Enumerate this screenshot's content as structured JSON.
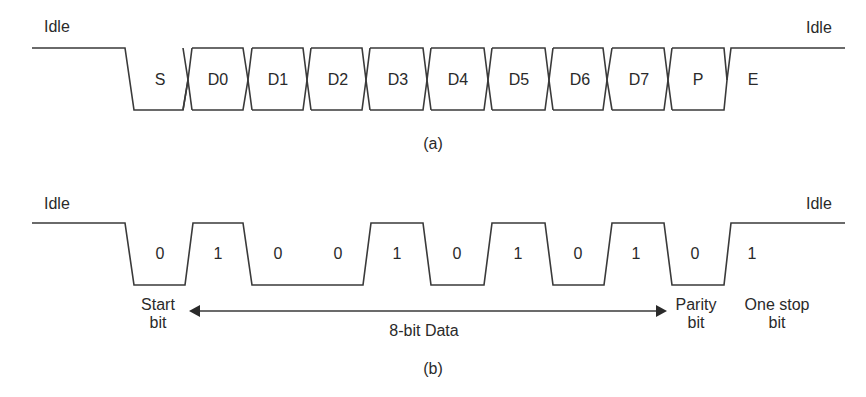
{
  "panel_a": {
    "idle_left": "Idle",
    "idle_right": "Idle",
    "caption": "(a)",
    "fields": [
      "S",
      "D0",
      "D1",
      "D2",
      "D3",
      "D4",
      "D5",
      "D6",
      "D7",
      "P",
      "E"
    ]
  },
  "panel_b": {
    "idle_left": "Idle",
    "idle_right": "Idle",
    "caption": "(b)",
    "bits": [
      "0",
      "1",
      "0",
      "0",
      "1",
      "0",
      "1",
      "0",
      "1",
      "0",
      "1"
    ],
    "annotations": {
      "start_bit_line1": "Start",
      "start_bit_line2": "bit",
      "data_label": "8-bit Data",
      "parity_line1": "Parity",
      "parity_line2": "bit",
      "stop_line1": "One stop",
      "stop_line2": "bit"
    }
  },
  "colors": {
    "line": "#3a3a3a",
    "text": "#2a2a2a",
    "background": "#ffffff"
  }
}
